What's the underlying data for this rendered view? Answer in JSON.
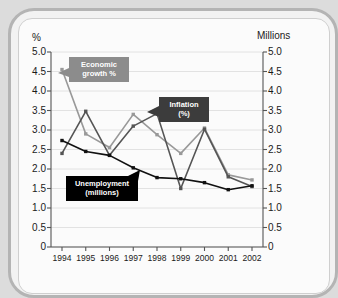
{
  "chart_data": {
    "type": "line",
    "title": "",
    "subtitle": "",
    "xlabel": "",
    "ylabel": "%",
    "y2label": "Millions",
    "categories": [
      "1994",
      "1995",
      "1996",
      "1997",
      "1998",
      "1999",
      "2000",
      "2001",
      "2002"
    ],
    "x": [
      1994,
      1995,
      1996,
      1997,
      1998,
      1999,
      2000,
      2001,
      2002
    ],
    "ylim": [
      0,
      5.0
    ],
    "y2lim": [
      0,
      5.0
    ],
    "yticks": [
      "5.0",
      "4.5",
      "4.0",
      "3.5",
      "3.0",
      "2.5",
      "2.0",
      "1.5",
      "1.0",
      "0.5",
      "0"
    ],
    "y2ticks": [
      "5.0",
      "4.5",
      "4.0",
      "3.5",
      "3.0",
      "2.5",
      "2.0",
      "1.5",
      "1.0",
      "0.5",
      "0"
    ],
    "grid": true,
    "legend": "annotations",
    "series": [
      {
        "name": "Economic growth %",
        "color": "#999999",
        "axis": "left",
        "values": [
          4.55,
          2.9,
          2.55,
          3.4,
          2.88,
          2.4,
          3.05,
          1.85,
          1.72
        ]
      },
      {
        "name": "Inflation (%)",
        "color": "#555555",
        "axis": "left",
        "values": [
          2.4,
          3.48,
          2.35,
          3.1,
          3.42,
          1.5,
          3.02,
          1.8,
          1.55
        ]
      },
      {
        "name": "Unemployment (millions)",
        "color": "#111111",
        "axis": "right",
        "values": [
          2.73,
          2.45,
          2.35,
          2.03,
          1.78,
          1.75,
          1.65,
          1.47,
          1.57
        ]
      }
    ],
    "annotations": [
      {
        "id": "growth",
        "text": "Economic\ngrowth %",
        "background": "#8c8c8c",
        "text_color": "#ffffff"
      },
      {
        "id": "inflation",
        "text": "Inflation\n(%)",
        "background": "#3c3c3c",
        "text_color": "#ffffff"
      },
      {
        "id": "unemployment",
        "text": "Unemployment\n(millions)",
        "background": "#000000",
        "text_color": "#ffffff"
      }
    ]
  },
  "axes": {
    "left_title": "%",
    "right_title": "Millions"
  },
  "colors": {
    "frame_border": "#b4b4b4",
    "page_background": "#dcdcdc",
    "panel_background": "#fbfbfb",
    "grid": "#e2e2e2",
    "axis": "#555555"
  }
}
